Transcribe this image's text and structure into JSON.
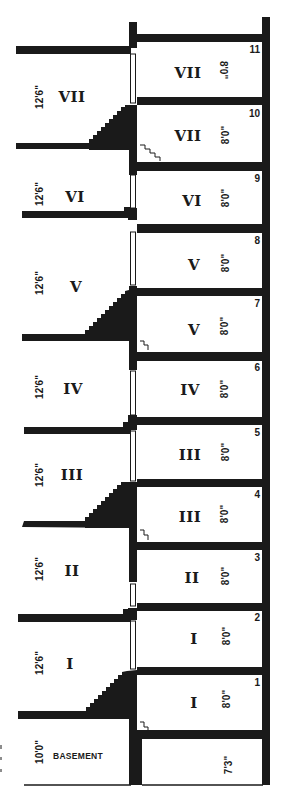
{
  "diagram": {
    "type": "architectural-building-section",
    "ink_color": "#1a1a1a",
    "paper_color": "#ffffff",
    "left_column": {
      "description": "Original tall-storey levels (12'6\" each), reached by stairs",
      "levels": [
        {
          "roman": "VII",
          "height": "12'6\"",
          "label_y": 97,
          "dim_y": 97
        },
        {
          "roman": "VI",
          "height": "12'6\"",
          "label_y": 197,
          "dim_y": 194
        },
        {
          "roman": "V",
          "height": "12'6\"",
          "label_y": 287,
          "dim_y": 283
        },
        {
          "roman": "IV",
          "height": "12'6\"",
          "label_y": 389,
          "dim_y": 387
        },
        {
          "roman": "III",
          "height": "12'6\"",
          "label_y": 475,
          "dim_y": 475
        },
        {
          "roman": "II",
          "height": "12'6\"",
          "label_y": 571,
          "dim_y": 569
        },
        {
          "roman": "I",
          "height": "12'6\"",
          "label_y": 664,
          "dim_y": 663
        }
      ],
      "basement": {
        "label": "BASEMENT",
        "height": "10'0\"",
        "label_y": 756,
        "dim_y": 752
      }
    },
    "right_column": {
      "description": "Split-level floors (8'0\" each), numbered 1-11",
      "floors": [
        {
          "number": "11",
          "roman": "VII",
          "height": "8'0\"",
          "top": 34
        },
        {
          "number": "10",
          "roman": "VII",
          "height": "8'0\"",
          "top": 97
        },
        {
          "number": "9",
          "roman": "VI",
          "height": "8'0\"",
          "top": 165
        },
        {
          "number": "8",
          "roman": "V",
          "height": "8'0\"",
          "top": 226
        },
        {
          "number": "7",
          "roman": "V",
          "height": "8'0\"",
          "top": 290
        },
        {
          "number": "6",
          "roman": "IV",
          "height": "8'0\"",
          "top": 355
        },
        {
          "number": "5",
          "roman": "III",
          "height": "8'0\"",
          "top": 420
        },
        {
          "number": "4",
          "roman": "III",
          "height": "8'0\"",
          "top": 482
        },
        {
          "number": "3",
          "roman": "II",
          "height": "8'0\"",
          "top": 545
        },
        {
          "number": "2",
          "roman": "I",
          "height": "8'0\"",
          "top": 606
        },
        {
          "number": "1",
          "roman": "I",
          "height": "8'0\"",
          "top": 670
        }
      ],
      "basement": {
        "height": "7'3\"",
        "top": 733
      }
    }
  },
  "labels": {
    "left": {
      "l7": "VII",
      "l6": "VI",
      "l5": "V",
      "l4": "IV",
      "l3": "III",
      "l2": "II",
      "l1": "I",
      "d7": "12'6\"",
      "d6": "12'6\"",
      "d5": "12'6\"",
      "d4": "12'6\"",
      "d3": "12'6\"",
      "d2": "12'6\"",
      "d1": "12'6\"",
      "basement": "BASEMENT",
      "dbase": "10'0\""
    },
    "right": {
      "r11": "VII",
      "r10": "VII",
      "r9": "VI",
      "r8": "V",
      "r7": "V",
      "r6": "IV",
      "r5": "III",
      "r4": "III",
      "r3": "II",
      "r2": "I",
      "r1": "I",
      "d11": "8'0\"",
      "d10": "8'0\"",
      "d9": "8'0\"",
      "d8": "8'0\"",
      "d7": "8'0\"",
      "d6": "8'0\"",
      "d5": "8'0\"",
      "d4": "8'0\"",
      "d3": "8'0\"",
      "d2": "8'0\"",
      "d1": "8'0\"",
      "dbase": "7'3\"",
      "n11": "11",
      "n10": "10",
      "n9": "9",
      "n8": "8",
      "n7": "7",
      "n6": "6",
      "n5": "5",
      "n4": "4",
      "n3": "3",
      "n2": "2",
      "n1": "1"
    }
  }
}
